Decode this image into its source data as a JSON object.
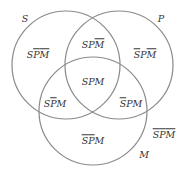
{
  "circles": [
    {
      "name": "S",
      "label": "S",
      "cx": 66,
      "cy": 65,
      "r": 54
    },
    {
      "name": "P",
      "label": "P",
      "cx": 119,
      "cy": 65,
      "r": 54
    },
    {
      "name": "M",
      "label": "M",
      "cx": 93,
      "cy": 111,
      "r": 54
    }
  ],
  "stroke_color": "#8a8a8a",
  "set_labels": {
    "S": "S",
    "P": "P",
    "M": "M"
  },
  "regions": {
    "s_only": {
      "parts": [
        [
          "S",
          false
        ],
        [
          "P",
          true
        ],
        [
          "M",
          true
        ]
      ]
    },
    "sp_only": {
      "parts": [
        [
          "S",
          false
        ],
        [
          "P",
          false
        ],
        [
          "M",
          true
        ]
      ]
    },
    "p_only": {
      "parts": [
        [
          "S",
          true
        ],
        [
          "P",
          false
        ],
        [
          "M",
          true
        ]
      ]
    },
    "spm": {
      "parts": [
        [
          "S",
          false
        ],
        [
          "P",
          false
        ],
        [
          "M",
          false
        ]
      ]
    },
    "sm_only": {
      "parts": [
        [
          "S",
          false
        ],
        [
          "P",
          true
        ],
        [
          "M",
          false
        ]
      ]
    },
    "pm_only": {
      "parts": [
        [
          "S",
          true
        ],
        [
          "P",
          false
        ],
        [
          "M",
          false
        ]
      ]
    },
    "m_only": {
      "parts": [
        [
          "S",
          true
        ],
        [
          "P",
          true
        ],
        [
          "M",
          false
        ]
      ]
    },
    "none": {
      "parts": [
        [
          "S",
          true
        ],
        [
          "P",
          true
        ],
        [
          "M",
          true
        ]
      ]
    }
  },
  "text": {
    "S": "S",
    "P": "P",
    "M": "M"
  }
}
